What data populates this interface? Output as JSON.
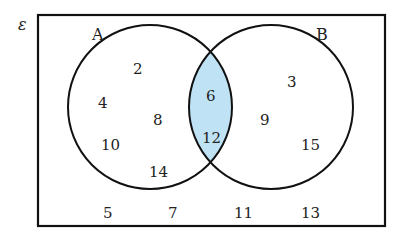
{
  "diagram": {
    "type": "venn",
    "universal_label": "ε",
    "sets": [
      {
        "name": "A",
        "label": "A",
        "only": [
          "2",
          "4",
          "8",
          "10",
          "14"
        ]
      },
      {
        "name": "B",
        "label": "B",
        "only": [
          "3",
          "9",
          "15"
        ]
      }
    ],
    "intersection": [
      "6",
      "12"
    ],
    "outside": [
      "5",
      "7",
      "11",
      "13"
    ],
    "shaded_region": "A ∩ B",
    "colors": {
      "shade": "#bfe3f5",
      "stroke": "#111111",
      "background": "#ffffff"
    }
  },
  "labels": {
    "epsilon": "ε",
    "A": "A",
    "B": "B"
  },
  "numbers": {
    "a2": "2",
    "a4": "4",
    "a8": "8",
    "a10": "10",
    "a14": "14",
    "ab6": "6",
    "ab12": "12",
    "b3": "3",
    "b9": "9",
    "b15": "15",
    "o5": "5",
    "o7": "7",
    "o11": "11",
    "o13": "13"
  }
}
